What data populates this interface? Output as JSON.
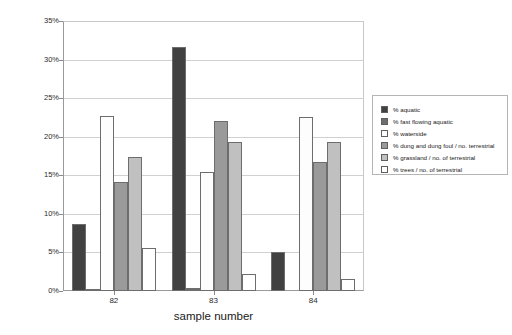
{
  "chart_data": {
    "type": "bar",
    "title": "",
    "xlabel": "sample number",
    "ylabel": "",
    "categories": [
      "82",
      "83",
      "84"
    ],
    "ylim": [
      0,
      35
    ],
    "ytick_values": [
      0,
      5,
      10,
      15,
      20,
      25,
      30,
      35
    ],
    "ytick_labels": [
      "0%",
      "5%",
      "10%",
      "15%",
      "20%",
      "25%",
      "30%",
      "35%"
    ],
    "grid": true,
    "legend_position": "right",
    "series": [
      {
        "name": "% aquatic",
        "color": "#414141",
        "values": [
          8.8,
          31.9,
          5.1
        ]
      },
      {
        "name": "% fast flowing aquatic",
        "color": "#6e6e6e",
        "values": [
          0.15,
          0.4,
          0.0
        ]
      },
      {
        "name": "% waterside",
        "color": "#fdfdfd",
        "values": [
          22.9,
          15.6,
          22.7
        ]
      },
      {
        "name": "% dung and dung foul / no. terrestrial",
        "color": "#9a9a9a",
        "values": [
          14.2,
          22.2,
          16.9
        ]
      },
      {
        "name": "% grassland / no. of terrestrial",
        "color": "#c0c0c0",
        "values": [
          17.5,
          19.5,
          19.5
        ]
      },
      {
        "name": "% trees / no. of terrestrial",
        "color": "#ffffff",
        "values": [
          5.6,
          2.2,
          1.6
        ]
      }
    ]
  }
}
